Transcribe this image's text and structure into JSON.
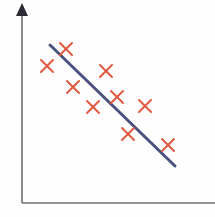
{
  "figure": {
    "title": "",
    "background_color": "#fefefe",
    "width": 215,
    "height": 217
  },
  "axes": {
    "origin": {
      "x": 22,
      "y": 203
    },
    "y_axis": {
      "name": "y-axis",
      "label": "",
      "x": 22,
      "y_top": 14,
      "y_bottom": 203,
      "color": "#6e6e70",
      "stroke_width": 1.6,
      "arrow": {
        "name": "y-axis-arrowhead",
        "tip_x": 22,
        "tip_y": 3,
        "base_y": 16,
        "half_width": 6,
        "color": "#2b2b33"
      }
    },
    "x_axis": {
      "name": "x-axis",
      "label": "",
      "y": 203,
      "x_left": 22,
      "x_right": 215,
      "color": "#6e6e70",
      "stroke_width": 1.6,
      "arrow": null
    },
    "ticks": [],
    "gridlines": false
  },
  "chart_data": {
    "type": "scatter",
    "title": "",
    "xlabel": "",
    "ylabel": "",
    "xlim": [
      0,
      215
    ],
    "ylim": [
      0,
      217
    ],
    "grid": false,
    "legend": null,
    "legend_position": "none",
    "marker": {
      "name": "x-marker",
      "shape": "x",
      "color": "#e0593f",
      "size": 12,
      "stroke_width": 2.0
    },
    "points_pixels": [
      {
        "x": 66,
        "y": 49
      },
      {
        "x": 47,
        "y": 66
      },
      {
        "x": 106,
        "y": 71
      },
      {
        "x": 73,
        "y": 87
      },
      {
        "x": 93,
        "y": 107
      },
      {
        "x": 117,
        "y": 97
      },
      {
        "x": 145,
        "y": 106
      },
      {
        "x": 128,
        "y": 134
      },
      {
        "x": 168,
        "y": 145
      }
    ],
    "series": [
      {
        "name": "observations",
        "x": [
          66,
          47,
          106,
          73,
          93,
          117,
          145,
          128,
          168
        ],
        "y": [
          154,
          137,
          132,
          116,
          96,
          106,
          97,
          69,
          58
        ]
      }
    ],
    "trendline": {
      "name": "regression-line",
      "label": "",
      "color": "#4c527f",
      "stroke_width": 3.0,
      "x1": 50,
      "y1": 45,
      "x2": 175,
      "y2": 166,
      "slope": -0.968,
      "direction": "negative",
      "correlation": "negative"
    },
    "annotations": []
  }
}
